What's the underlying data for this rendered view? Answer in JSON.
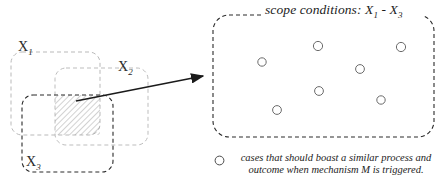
{
  "figure": {
    "background_color": "#ffffff"
  },
  "left_diagram": {
    "name": "overlapping condition sets",
    "sets": [
      {
        "id": "x1",
        "label": "X",
        "subscript": "1",
        "label_x": 18,
        "label_y": 40,
        "rect": {
          "x": 11,
          "y": 52,
          "w": 89,
          "h": 83,
          "rx": 11
        },
        "stroke": "#b9b9b9",
        "dash": "4 3"
      },
      {
        "id": "x2",
        "label": "X",
        "subscript": "2",
        "label_x": 118,
        "label_y": 60,
        "rect": {
          "x": 55,
          "y": 68,
          "w": 93,
          "h": 77,
          "rx": 11
        },
        "stroke": "#bdbdbd",
        "dash": "4 3"
      },
      {
        "id": "x3",
        "label": "X",
        "subscript": "3",
        "label_x": 26,
        "label_y": 155,
        "rect": {
          "x": 22,
          "y": 95,
          "w": 91,
          "h": 77,
          "rx": 11
        },
        "stroke": "#2a2a2a",
        "dash": "4 3"
      }
    ],
    "intersection": {
      "name": "triple-overlap hatched region",
      "rect": {
        "x": 55,
        "y": 95,
        "w": 45,
        "h": 40
      },
      "hatch_color": "#8f8f8f",
      "hatch_spacing": 4
    },
    "arrow": {
      "name": "mapping arrow",
      "from_x": 76,
      "from_y": 101,
      "to_x": 206,
      "to_y": 75,
      "color": "#1a1a1a"
    }
  },
  "scope_panel": {
    "name": "scope conditions panel",
    "title_prefix": "scope conditions: X",
    "title_sub1": "1",
    "title_dash": " - X",
    "title_sub2": "3",
    "title_full": "scope conditions: X1 - X3",
    "rect": {
      "x": 213,
      "y": 15,
      "w": 221,
      "h": 122,
      "rx": 16
    },
    "stroke": "#2a2a2a",
    "dash": "4 3",
    "cases": [
      {
        "id": "case-1",
        "cx": 262,
        "cy": 62,
        "r": 4.2
      },
      {
        "id": "case-2",
        "cx": 318,
        "cy": 46,
        "r": 4.6
      },
      {
        "id": "case-3",
        "cx": 401,
        "cy": 47,
        "r": 4.6
      },
      {
        "id": "case-4",
        "cx": 360,
        "cy": 69,
        "r": 4.4
      },
      {
        "id": "case-5",
        "cx": 319,
        "cy": 91,
        "r": 4.4
      },
      {
        "id": "case-6",
        "cx": 381,
        "cy": 100,
        "r": 4.2
      },
      {
        "id": "case-7",
        "cx": 277,
        "cy": 110,
        "r": 4.4
      }
    ],
    "case_stroke": "#6b6b6b"
  },
  "legend": {
    "marker_name": "case-circle-marker",
    "marker_r": 4.6,
    "marker_stroke": "#4a4a4a",
    "line_1": "cases that should boast a similar process and",
    "line_2": "outcome when mechanism M is triggered.",
    "text": "cases that should boast a similar process and outcome when mechanism M is triggered."
  },
  "colors": {
    "ink": "#1c1c1c",
    "light_dash": "#bdbdbd",
    "dark_dash": "#2a2a2a",
    "hatch": "#8f8f8f",
    "background": "#ffffff"
  }
}
